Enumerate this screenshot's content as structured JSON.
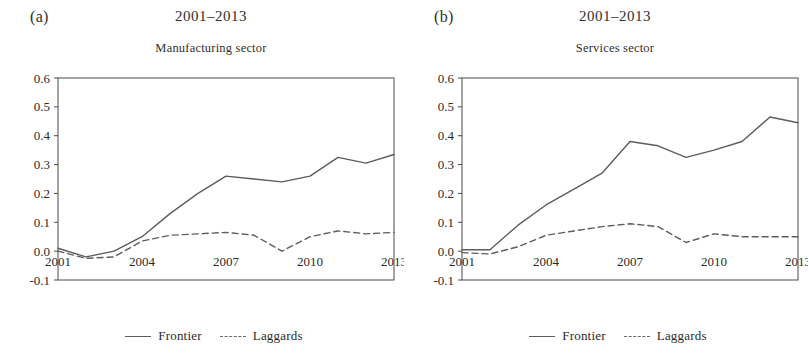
{
  "figure": {
    "background": "#ffffff",
    "line_color": "#5d5d5d",
    "axis_color": "#4a4a4a",
    "text_color": "#2b2b2b"
  },
  "panels": [
    {
      "tag": "(a)",
      "period": "2001–2013",
      "subtitle": "Manufacturing sector",
      "legend": [
        {
          "label": "Frontier",
          "style": "solid"
        },
        {
          "label": "Laggards",
          "style": "dashed"
        }
      ]
    },
    {
      "tag": "(b)",
      "period": "2001–2013",
      "subtitle": "Services sector",
      "legend": [
        {
          "label": "Frontier",
          "style": "solid"
        },
        {
          "label": "Laggards",
          "style": "dashed"
        }
      ]
    }
  ],
  "chart_data": [
    {
      "type": "line",
      "title": "2001–2013",
      "subtitle": "Manufacturing sector",
      "panel_tag": "(a)",
      "xlabel": "",
      "ylabel": "",
      "x": [
        2001,
        2002,
        2003,
        2004,
        2005,
        2006,
        2007,
        2008,
        2009,
        2010,
        2011,
        2012,
        2013
      ],
      "xticks": [
        2001,
        2004,
        2007,
        2010,
        2013
      ],
      "xticklabels": [
        "2001",
        "2004",
        "2007",
        "2010",
        "2013"
      ],
      "yticks": [
        -0.1,
        0.0,
        0.1,
        0.2,
        0.3,
        0.4,
        0.5,
        0.6
      ],
      "yticklabels": [
        "-0.1",
        "0.0",
        "0.1",
        "0.2",
        "0.3",
        "0.4",
        "0.5",
        "0.6"
      ],
      "ylim": [
        -0.1,
        0.6
      ],
      "xlim": [
        2001,
        2013
      ],
      "grid": false,
      "legend_position": "bottom-center",
      "series": [
        {
          "name": "Frontier",
          "style": "solid",
          "values": [
            0.01,
            -0.02,
            0.0,
            0.05,
            0.13,
            0.2,
            0.26,
            0.25,
            0.24,
            0.26,
            0.325,
            0.305,
            0.335
          ]
        },
        {
          "name": "Laggards",
          "style": "dashed",
          "values": [
            0.0,
            -0.025,
            -0.02,
            0.035,
            0.055,
            0.06,
            0.065,
            0.055,
            0.0,
            0.05,
            0.07,
            0.06,
            0.065
          ]
        }
      ]
    },
    {
      "type": "line",
      "title": "2001–2013",
      "subtitle": "Services sector",
      "panel_tag": "(b)",
      "xlabel": "",
      "ylabel": "",
      "x": [
        2001,
        2002,
        2003,
        2004,
        2005,
        2006,
        2007,
        2008,
        2009,
        2010,
        2011,
        2012,
        2013
      ],
      "xticks": [
        2001,
        2004,
        2007,
        2010,
        2013
      ],
      "xticklabels": [
        "2001",
        "2004",
        "2007",
        "2010",
        "2013"
      ],
      "yticks": [
        -0.1,
        0.0,
        0.1,
        0.2,
        0.3,
        0.4,
        0.5,
        0.6
      ],
      "yticklabels": [
        "-0.1",
        "0.0",
        "0.1",
        "0.2",
        "0.3",
        "0.4",
        "0.5",
        "0.6"
      ],
      "ylim": [
        -0.1,
        0.6
      ],
      "xlim": [
        2001,
        2013
      ],
      "grid": false,
      "legend_position": "bottom-center",
      "series": [
        {
          "name": "Frontier",
          "style": "solid",
          "values": [
            0.005,
            0.005,
            0.09,
            0.16,
            0.215,
            0.27,
            0.38,
            0.365,
            0.325,
            0.35,
            0.38,
            0.465,
            0.445
          ]
        },
        {
          "name": "Laggards",
          "style": "dashed",
          "values": [
            -0.005,
            -0.01,
            0.015,
            0.055,
            0.07,
            0.085,
            0.095,
            0.085,
            0.03,
            0.06,
            0.05,
            0.05,
            0.05
          ]
        }
      ]
    }
  ]
}
